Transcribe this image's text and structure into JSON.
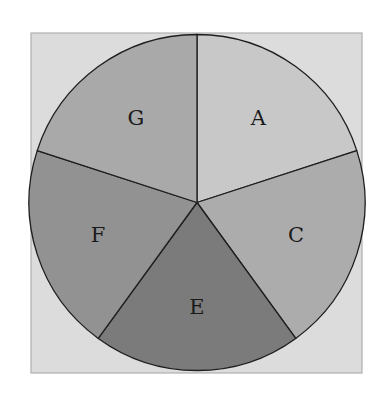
{
  "chart_data": {
    "type": "pie",
    "title": "",
    "categories": [
      "A",
      "C",
      "E",
      "F",
      "G"
    ],
    "values": [
      20,
      20,
      20,
      20,
      20
    ],
    "start_angle_deg": 90,
    "direction": "clockwise",
    "colors": [
      "#c8c8c8",
      "#acacac",
      "#7b7b7b",
      "#929292",
      "#a9a9a9"
    ],
    "background_color": "#dcdcdc",
    "legend": "none",
    "labels_inside": true
  }
}
